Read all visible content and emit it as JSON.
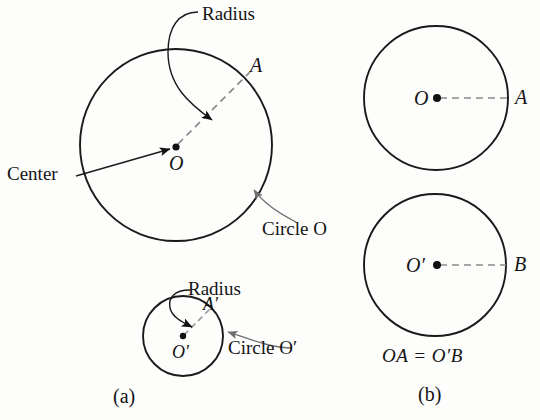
{
  "figure": {
    "background_color": "#fdfdfc",
    "stroke_color": "#1a1a1a",
    "dashed_color": "#8a8a8a",
    "leader_color": "#6e6e6e"
  },
  "panel_a": {
    "caption": "(a)",
    "large_circle": {
      "center_label": "O",
      "point_label": "A",
      "radius_callout": "Radius",
      "center_callout": "Center",
      "circle_callout": "Circle O",
      "cx": 176,
      "cy": 145,
      "r": 96
    },
    "small_circle": {
      "center_label": "O′",
      "point_label": "A′",
      "radius_callout": "Radius",
      "circle_callout": "Circle O′",
      "cx": 183,
      "cy": 336,
      "r": 40
    }
  },
  "panel_b": {
    "caption": "(b)",
    "equation": "OA = O′B",
    "top_circle": {
      "center_label": "O",
      "point_label": "A",
      "cx": 436,
      "cy": 98,
      "r": 72
    },
    "bottom_circle": {
      "center_label": "O′",
      "point_label": "B",
      "cx": 435,
      "cy": 265,
      "r": 71
    }
  }
}
